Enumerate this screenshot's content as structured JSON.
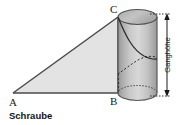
{
  "figure": {
    "caption": "Schraube",
    "vertices": {
      "a": "A",
      "b": "B",
      "c": "C"
    },
    "dimension": {
      "label": "Ganghöhe"
    },
    "colors": {
      "background": "#ffffff",
      "triangle_fill": "#e3e3e3",
      "triangle_stroke": "#4a4a4a",
      "cylinder_light": "#d6d6d6",
      "cylinder_mid": "#b4b4b4",
      "cylinder_dark": "#8c8c8c",
      "cylinder_stroke": "#555555",
      "top_ellipse_fill": "#b9b9b9",
      "helix_stroke": "#2e2e2e",
      "dimension_stroke": "#1a1a1a",
      "text": "#1a1a1a"
    },
    "geometry": {
      "a_point": "13,93",
      "b_point": "118,93",
      "c_point": "118,17",
      "cylinder_left": "118",
      "cylinder_right": "157",
      "cylinder_top": "17",
      "cylinder_bottom": "93",
      "ellipse_ry": "7.5",
      "dimension_x": "167",
      "dimension_top": "17",
      "dimension_bottom": "93"
    }
  }
}
